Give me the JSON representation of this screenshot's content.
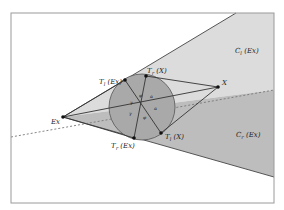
{
  "diagram": {
    "frame": {
      "x": 11,
      "y": 13,
      "width": 263,
      "height": 190,
      "stroke": "#9a9a9a"
    },
    "colors": {
      "background": "#ffffff",
      "cone_light": "#dcdcdc",
      "cone_dark": "#bdbdbd",
      "circle_fill": "#a9a9a9",
      "line": "#333333",
      "dashed": "#777777",
      "point": "#111111"
    },
    "regions": [
      {
        "id": "C_l",
        "label_main": "C",
        "label_sub": "l",
        "label_rest": " (Ex)"
      },
      {
        "id": "C_r",
        "label_main": "C",
        "label_sub": "r",
        "label_rest": " (Ex)"
      }
    ],
    "points": [
      {
        "id": "Ex",
        "label": "Ex",
        "x": 63,
        "y": 117
      },
      {
        "id": "X",
        "label": "X",
        "x": 218,
        "y": 87
      },
      {
        "id": "Tl_Ex",
        "label_main": "T",
        "label_sub": "l",
        "label_rest": " (Ex)",
        "x": 125,
        "y": 80
      },
      {
        "id": "Tr_X",
        "label_main": "T",
        "label_sub": "r",
        "label_rest": " (X)",
        "x": 146,
        "y": 76
      },
      {
        "id": "Tl_X",
        "label_main": "T",
        "label_sub": "l",
        "label_rest": " (X)",
        "x": 161,
        "y": 133
      },
      {
        "id": "Tr_Ex",
        "label_main": "T",
        "label_sub": "r",
        "label_rest": " (Ex)",
        "x": 134,
        "y": 138
      }
    ],
    "circle": {
      "cx": 142,
      "cy": 107,
      "r": 33
    },
    "angles": [
      {
        "symbol": "γ",
        "x": 130,
        "y": 104
      },
      {
        "symbol": "γ",
        "x": 129,
        "y": 115
      },
      {
        "symbol": "φ",
        "x": 139,
        "y": 97
      },
      {
        "symbol": "φ",
        "x": 143,
        "y": 119
      },
      {
        "symbol": "α",
        "x": 150,
        "y": 98
      },
      {
        "symbol": "α",
        "x": 154,
        "y": 110
      }
    ]
  }
}
